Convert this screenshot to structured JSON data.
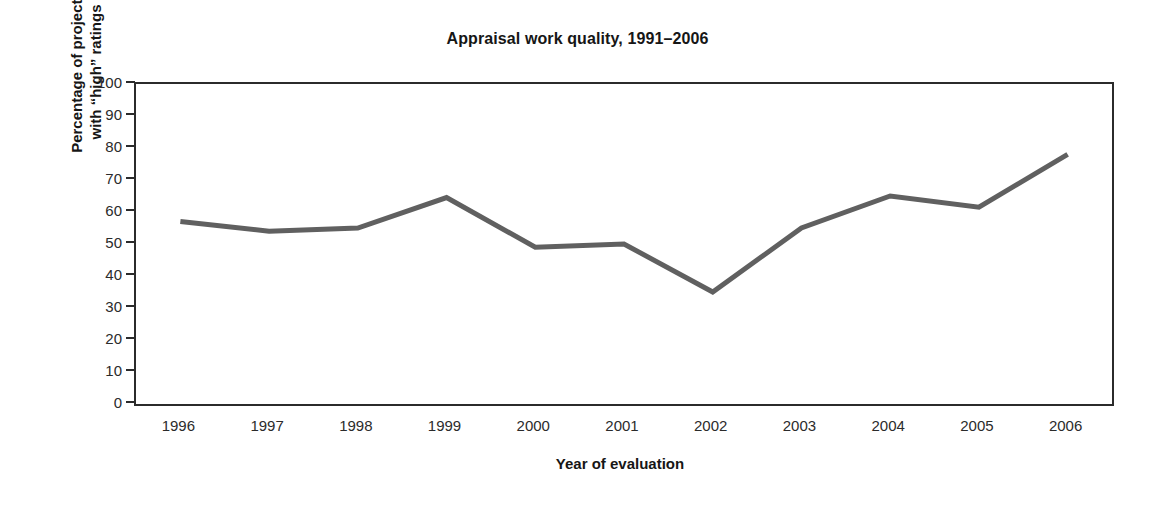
{
  "chart_data": {
    "type": "line",
    "title": "Appraisal work quality, 1991–2006",
    "xlabel": "Year of evaluation",
    "ylabel_line1": "Percentage of projects",
    "ylabel_line2": "with “high” ratings",
    "categories": [
      "1996",
      "1997",
      "1998",
      "1999",
      "2000",
      "2001",
      "2002",
      "2003",
      "2004",
      "2005",
      "2006"
    ],
    "values": [
      57,
      54,
      55,
      64.5,
      49,
      50,
      35,
      55,
      65,
      61.5,
      78
    ],
    "series": [
      {
        "name": "Percentage of projects with “high” ratings",
        "values": [
          57,
          54,
          55,
          64.5,
          49,
          50,
          35,
          55,
          65,
          61.5,
          78
        ]
      }
    ],
    "ylim": [
      0,
      100
    ],
    "yticks": [
      0,
      10,
      20,
      30,
      40,
      50,
      60,
      70,
      80,
      90,
      100
    ],
    "ytick_labels": [
      "0",
      "10",
      "20",
      "30",
      "40",
      "50",
      "60",
      "70",
      "80",
      "90",
      "100"
    ],
    "grid": false,
    "legend": "none",
    "line_color": "#606060",
    "line_width_px": 5,
    "axis_color": "#2b2b2b",
    "background": "#ffffff"
  }
}
